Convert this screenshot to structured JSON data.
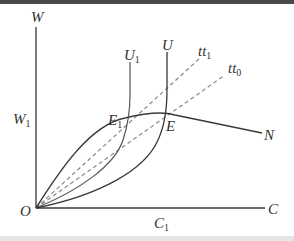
{
  "diagram": {
    "axes": {
      "y_label": "W",
      "x_label": "C",
      "origin_label": "O",
      "y_tick": {
        "label": "W",
        "sub": "1"
      },
      "x_tick": {
        "label": "C",
        "sub": "1"
      }
    },
    "curves": {
      "U1": {
        "label": "U",
        "sub": "1"
      },
      "U": {
        "label": "U",
        "sub": ""
      },
      "tt1": {
        "label": "tt",
        "sub": "1"
      },
      "tt0": {
        "label": "tt",
        "sub": "0"
      },
      "N": {
        "label": "N"
      }
    },
    "points": {
      "E1": {
        "label": "E",
        "sub": "1"
      },
      "E": {
        "label": "E"
      }
    },
    "colors": {
      "line": "#3a3a3a",
      "dashed": "#888888",
      "top_strip": "#4a4a4a",
      "bottom_strip": "#e6e6e6"
    }
  }
}
